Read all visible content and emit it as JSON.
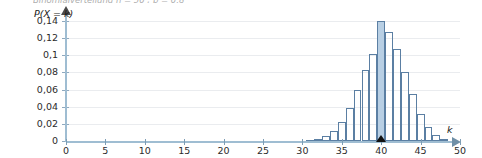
{
  "top_caption": "Binomialverteilung  n = 50 ;  p = 0,8",
  "axes": {
    "y_title": "P(X = k)",
    "x_title": "k",
    "y_ticks": [
      "0",
      "0,02",
      "0,04",
      "0,06",
      "0,08",
      "0,1",
      "0,12",
      "0,14"
    ],
    "x_ticks": [
      "0",
      "5",
      "10",
      "15",
      "20",
      "25",
      "30",
      "35",
      "40",
      "45",
      "50"
    ],
    "colors": {
      "axis": "#9fbdd2",
      "grid": "#eaecef",
      "bar_stroke": "#5b7fa3",
      "bar_highlight_fill": "#b8cfe4",
      "marker": "#111111"
    }
  },
  "chart_data": {
    "type": "bar",
    "xlabel": "k",
    "ylabel": "P(X = k)",
    "xlim": [
      0,
      50
    ],
    "ylim": [
      0,
      0.14
    ],
    "grid": true,
    "legend": null,
    "highlight_category": 40,
    "marker_at": 40,
    "categories": [
      0,
      1,
      2,
      3,
      4,
      5,
      6,
      7,
      8,
      9,
      10,
      11,
      12,
      13,
      14,
      15,
      16,
      17,
      18,
      19,
      20,
      21,
      22,
      23,
      24,
      25,
      26,
      27,
      28,
      29,
      30,
      31,
      32,
      33,
      34,
      35,
      36,
      37,
      38,
      39,
      40,
      41,
      42,
      43,
      44,
      45,
      46,
      47,
      48,
      49,
      50
    ],
    "values": [
      0,
      0,
      0,
      0,
      0,
      0,
      0,
      0,
      0,
      0,
      0,
      0,
      0,
      0,
      0,
      0,
      0,
      0,
      0,
      0,
      0,
      0,
      0,
      0,
      0,
      0,
      0,
      0,
      0,
      0.0001,
      0.0003,
      0.0008,
      0.0022,
      0.0053,
      0.0114,
      0.022,
      0.0382,
      0.0595,
      0.0827,
      0.1017,
      0.1398,
      0.1271,
      0.107,
      0.081,
      0.0544,
      0.032,
      0.0161,
      0.0068,
      0.0023,
      0.0006,
      0.0001
    ]
  }
}
